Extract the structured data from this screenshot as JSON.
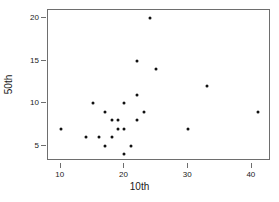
{
  "chart_data": {
    "type": "scatter",
    "title": "",
    "xlabel": "10th",
    "ylabel": "50th",
    "xlim": [
      8,
      43
    ],
    "ylim": [
      3.2,
      21
    ],
    "xticks": [
      10,
      20,
      30,
      40
    ],
    "yticks": [
      5,
      10,
      15,
      20
    ],
    "xticklabels": [
      "10",
      "20",
      "30",
      "40"
    ],
    "yticklabels": [
      "5",
      "10",
      "15",
      "20"
    ],
    "grid": false,
    "legend": null,
    "marker": {
      "shape": "circle",
      "color": "#111111",
      "size": 3
    },
    "frame": {
      "color": "#6e6e6e",
      "visible": true
    },
    "points": [
      {
        "x": 10,
        "y": 7
      },
      {
        "x": 14,
        "y": 6
      },
      {
        "x": 15,
        "y": 10
      },
      {
        "x": 16,
        "y": 6
      },
      {
        "x": 17,
        "y": 9
      },
      {
        "x": 17,
        "y": 5
      },
      {
        "x": 18,
        "y": 8
      },
      {
        "x": 18,
        "y": 6
      },
      {
        "x": 19,
        "y": 8
      },
      {
        "x": 19,
        "y": 7
      },
      {
        "x": 20,
        "y": 10
      },
      {
        "x": 20,
        "y": 7
      },
      {
        "x": 20,
        "y": 4
      },
      {
        "x": 21,
        "y": 5
      },
      {
        "x": 22,
        "y": 15
      },
      {
        "x": 22,
        "y": 11
      },
      {
        "x": 22,
        "y": 8
      },
      {
        "x": 23,
        "y": 9
      },
      {
        "x": 24,
        "y": 20
      },
      {
        "x": 25,
        "y": 14
      },
      {
        "x": 30,
        "y": 7
      },
      {
        "x": 33,
        "y": 12
      },
      {
        "x": 41,
        "y": 9
      }
    ]
  }
}
